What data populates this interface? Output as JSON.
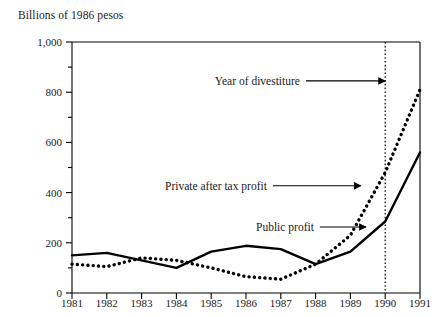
{
  "chart_data": {
    "type": "line",
    "title": "Billions of 1986 pesos",
    "xlabel": "",
    "ylabel": "Billions of 1986 pesos",
    "xlim": [
      1981,
      1991
    ],
    "ylim": [
      0,
      1000
    ],
    "grid": false,
    "legend_position": "inline-annotations",
    "x": [
      1981,
      1982,
      1983,
      1984,
      1985,
      1986,
      1987,
      1988,
      1989,
      1990,
      1991
    ],
    "xticklabels": [
      "1981",
      "1982",
      "1983",
      "1984",
      "1985",
      "1986",
      "1987",
      "1988",
      "1989",
      "1990",
      "1991"
    ],
    "yticks": [
      0,
      200,
      400,
      600,
      800,
      1000
    ],
    "yticklabels": [
      "0",
      "200",
      "400",
      "600",
      "800",
      "1,000"
    ],
    "yminorticks": [
      100,
      300,
      500,
      700,
      900
    ],
    "series": [
      {
        "name": "Public profit",
        "style": "solid",
        "color": "#000000",
        "values": [
          150,
          160,
          130,
          100,
          165,
          188,
          175,
          115,
          165,
          285,
          560
        ]
      },
      {
        "name": "Private after tax profit",
        "style": "dotted",
        "color": "#000000",
        "values": [
          115,
          105,
          140,
          130,
          100,
          65,
          55,
          115,
          230,
          480,
          810
        ]
      }
    ],
    "annotations": [
      {
        "text": "Year of divestiture",
        "label_x": 1987.55,
        "label_y": 845,
        "arrow_to_x": 1990.0,
        "arrow_to_y": 845,
        "anchor": "end"
      },
      {
        "text": "Private after tax profit",
        "label_x": 1986.6,
        "label_y": 427,
        "arrow_to_x": 1989.3,
        "arrow_to_y": 427,
        "anchor": "end"
      },
      {
        "text": "Public profit",
        "label_x": 1987.95,
        "label_y": 263,
        "arrow_to_x": 1989.45,
        "arrow_to_y": 263,
        "anchor": "end"
      }
    ],
    "vertical_marker": {
      "name": "Year of divestiture",
      "x": 1990,
      "style": "dotted",
      "color": "#000000"
    }
  }
}
